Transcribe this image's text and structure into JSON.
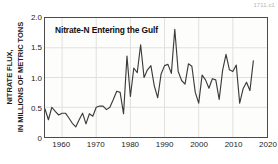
{
  "figure": {
    "id_text": "1711.c1"
  },
  "chart_data": {
    "type": "line",
    "title": "Nitrate-N Entering the Gulf",
    "xlabel": "",
    "ylabel": "NITRATE FLUX, IN MILLIONS OF METRIC TONS",
    "ylabel_lines": [
      "NITRATE FLUX,",
      "IN MILLIONS OF METRIC TONS"
    ],
    "xlim": [
      1955,
      2020
    ],
    "ylim": [
      0,
      2.0
    ],
    "yticks": [
      0,
      0.5,
      1.0,
      1.5,
      2.0
    ],
    "ytick_labels": [
      "0",
      "0.5",
      "1.0",
      "1.5",
      "2.0"
    ],
    "xticks": [
      1960,
      1970,
      1980,
      1990,
      2000,
      2010,
      2020
    ],
    "xtick_labels": [
      "1960",
      "1970",
      "1980",
      "1990",
      "2000",
      "2010",
      "2020"
    ],
    "grid": "both-faint",
    "legend": "none",
    "line_color": "#3c3c3c",
    "series": [
      {
        "name": "Nitrate-N flux",
        "x": [
          1955,
          1956,
          1957,
          1958,
          1959,
          1960,
          1961,
          1962,
          1963,
          1964,
          1965,
          1966,
          1967,
          1968,
          1969,
          1970,
          1971,
          1972,
          1973,
          1974,
          1975,
          1976,
          1977,
          1978,
          1979,
          1980,
          1981,
          1982,
          1983,
          1984,
          1985,
          1986,
          1987,
          1988,
          1989,
          1990,
          1991,
          1992,
          1993,
          1994,
          1995,
          1996,
          1997,
          1998,
          1999,
          2000,
          2001,
          2002,
          2003,
          2004,
          2005,
          2006,
          2007,
          2008,
          2009,
          2010,
          2011,
          2012,
          2013,
          2014,
          2015,
          2016
        ],
        "values": [
          0.47,
          0.29,
          0.5,
          0.43,
          0.37,
          0.4,
          0.4,
          0.32,
          0.23,
          0.17,
          0.29,
          0.4,
          0.22,
          0.39,
          0.35,
          0.5,
          0.52,
          0.52,
          0.46,
          0.5,
          0.63,
          0.77,
          0.75,
          0.39,
          1.36,
          0.68,
          1.16,
          1.08,
          1.55,
          1.0,
          1.13,
          1.2,
          0.86,
          0.66,
          1.06,
          1.2,
          1.22,
          1.07,
          1.81,
          1.1,
          0.95,
          0.89,
          1.23,
          1.19,
          0.75,
          0.57,
          1.04,
          0.96,
          0.82,
          0.98,
          0.96,
          0.63,
          1.12,
          1.39,
          1.13,
          1.1,
          1.21,
          0.57,
          0.81,
          0.92,
          0.78,
          1.28
        ]
      }
    ]
  }
}
